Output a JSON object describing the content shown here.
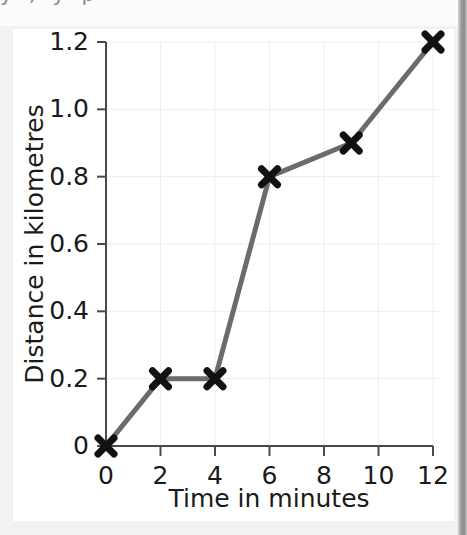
{
  "scan": {
    "top_cut_text": "y , y p",
    "card_background": "#ffffff",
    "page_background": "#f2f2f2",
    "edge_shadow_color": "#8c8c8c"
  },
  "chart_data": {
    "type": "line",
    "title": "",
    "subtitle": "",
    "xlabel": "Time in minutes",
    "ylabel": "Distance in kilometres",
    "xlim": [
      0,
      12
    ],
    "ylim": [
      0,
      1.2
    ],
    "xticks": [
      0,
      2,
      4,
      6,
      8,
      10,
      12
    ],
    "xtick_labels": [
      "0",
      "2",
      "4",
      "6",
      "8",
      "10",
      "12"
    ],
    "yticks": [
      0,
      0.2,
      0.4,
      0.6,
      0.8,
      1.0,
      1.2
    ],
    "ytick_labels": [
      "0",
      "0.2",
      "0.4",
      "0.6",
      "0.8",
      "1.0",
      "1.2"
    ],
    "grid": true,
    "legend": false,
    "legend_position": "none",
    "marker": "x",
    "marker_color": "#111111",
    "line_color": "#6b6b6b",
    "series": [
      {
        "name": "Journey",
        "x": [
          0,
          2,
          4,
          6,
          9,
          12
        ],
        "values": [
          0,
          0.2,
          0.2,
          0.8,
          0.9,
          1.2
        ],
        "points": [
          {
            "x": 0,
            "y": 0
          },
          {
            "x": 2,
            "y": 0.2
          },
          {
            "x": 4,
            "y": 0.2
          },
          {
            "x": 6,
            "y": 0.8
          },
          {
            "x": 9,
            "y": 0.9
          },
          {
            "x": 12,
            "y": 1.2
          }
        ]
      }
    ],
    "annotations": []
  }
}
